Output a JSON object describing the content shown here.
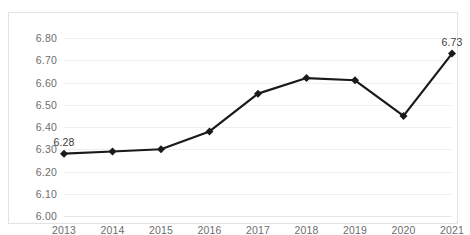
{
  "figure": {
    "top_remnant_text": "___  ____  ___",
    "frame_border_color": "#e2e2e2",
    "background_color": "#ffffff",
    "gridline_color": "#efefef",
    "series_color": "#1a1a1a",
    "tick_label_color": "#6d6d6d",
    "data_label_color": "#3d3d3d"
  },
  "chart_data": {
    "type": "line",
    "title": "",
    "subtitle": "",
    "xlabel": "",
    "ylabel": "",
    "categories": [
      "2013",
      "2014",
      "2015",
      "2016",
      "2017",
      "2018",
      "2019",
      "2020",
      "2021"
    ],
    "values": [
      6.28,
      6.29,
      6.3,
      6.38,
      6.55,
      6.62,
      6.61,
      6.45,
      6.73
    ],
    "point_labels": [
      {
        "category": "2013",
        "value": 6.28,
        "text": "6.28"
      },
      {
        "category": "2021",
        "value": 6.73,
        "text": "6.73"
      }
    ],
    "ylim": [
      6.0,
      6.8
    ],
    "ytick_values": [
      6.0,
      6.1,
      6.2,
      6.3,
      6.4,
      6.5,
      6.6,
      6.7,
      6.8
    ],
    "ytick_labels": [
      "6.00",
      "6.10",
      "6.20",
      "6.30",
      "6.40",
      "6.50",
      "6.60",
      "6.70",
      "6.80"
    ],
    "xtick_labels": [
      "2013",
      "2014",
      "2015",
      "2016",
      "2017",
      "2018",
      "2019",
      "2020",
      "2021"
    ],
    "grid": "horizontal",
    "legend": "none",
    "marker": "diamond",
    "marker_size": 4,
    "line_width": 2.2,
    "series": [
      {
        "name": "series-1",
        "values": [
          6.28,
          6.29,
          6.3,
          6.38,
          6.55,
          6.62,
          6.61,
          6.45,
          6.73
        ]
      }
    ],
    "annotations": [
      "6.28",
      "6.73"
    ]
  }
}
